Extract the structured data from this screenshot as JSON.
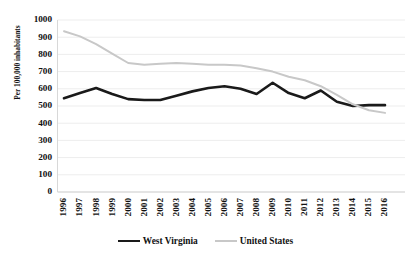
{
  "chart_data": {
    "type": "line",
    "title": "",
    "xlabel": "",
    "ylabel": "Per 100,000 inhabitants",
    "ylim": [
      0,
      1000
    ],
    "ytick_step": 100,
    "grid": true,
    "legend_position": "bottom",
    "categories": [
      "1996",
      "1997",
      "1998",
      "1999",
      "2000",
      "2001",
      "2002",
      "2003",
      "2004",
      "2005",
      "2006",
      "2007",
      "2008",
      "2009",
      "2010",
      "2011",
      "2012",
      "2013",
      "2014",
      "2015",
      "2016"
    ],
    "yticks": [
      "1000",
      "900",
      "800",
      "700",
      "600",
      "500",
      "400",
      "300",
      "200",
      "100",
      "0"
    ],
    "series": [
      {
        "name": "West Virginia",
        "color": "#1a1a1a",
        "values": [
          545,
          575,
          605,
          570,
          540,
          535,
          535,
          560,
          585,
          605,
          615,
          600,
          570,
          635,
          575,
          545,
          590,
          525,
          500,
          505,
          505
        ]
      },
      {
        "name": "United States",
        "color": "#c8c8c8",
        "values": [
          935,
          905,
          860,
          805,
          750,
          740,
          745,
          750,
          745,
          740,
          740,
          735,
          720,
          700,
          670,
          650,
          615,
          565,
          510,
          475,
          460
        ]
      }
    ]
  },
  "legend": {
    "entries": [
      {
        "label": "West Virginia"
      },
      {
        "label": "United States"
      }
    ]
  }
}
